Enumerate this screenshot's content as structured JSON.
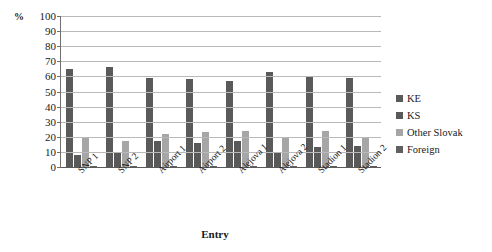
{
  "chart_data": {
    "type": "bar",
    "title": "",
    "subtitle": "",
    "xlabel": "Entry",
    "ylabel": "%",
    "ylim": [
      0,
      100
    ],
    "ytick_step": 10,
    "yticks": [
      100,
      90,
      80,
      70,
      60,
      50,
      40,
      30,
      20,
      10,
      0
    ],
    "grid": true,
    "grid_axis": "y",
    "legend_position": "right",
    "categories": [
      "SNP 1",
      "SNP 2",
      "Airport 1",
      "Airport 2",
      "Alejova 1",
      "Alejova 2",
      "Stadion 1",
      "Stadion 2"
    ],
    "series": [
      {
        "name": "KE",
        "color": "#5a5a5a",
        "values": [
          65,
          66,
          59,
          58,
          57,
          63,
          60,
          59
        ]
      },
      {
        "name": "KS",
        "color": "#595959",
        "values": [
          8,
          9,
          17,
          16,
          17,
          10,
          13,
          14
        ]
      },
      {
        "name": "Other Slovak",
        "color": "#a6a6a6",
        "values": [
          19,
          17,
          22,
          23,
          24,
          19,
          24,
          20
        ]
      },
      {
        "name": "Foreign",
        "color": "#606060",
        "values": [
          1,
          1,
          1,
          1,
          1,
          1,
          1,
          1
        ]
      }
    ]
  },
  "legend": {
    "items": [
      {
        "label": "KE",
        "color": "#5a5a5a"
      },
      {
        "label": "KS",
        "color": "#595959"
      },
      {
        "label": "Other Slovak",
        "color": "#a6a6a6"
      },
      {
        "label": "Foreign",
        "color": "#606060"
      }
    ]
  },
  "axis": {
    "y_unit": "%",
    "x_title": "Entry"
  }
}
